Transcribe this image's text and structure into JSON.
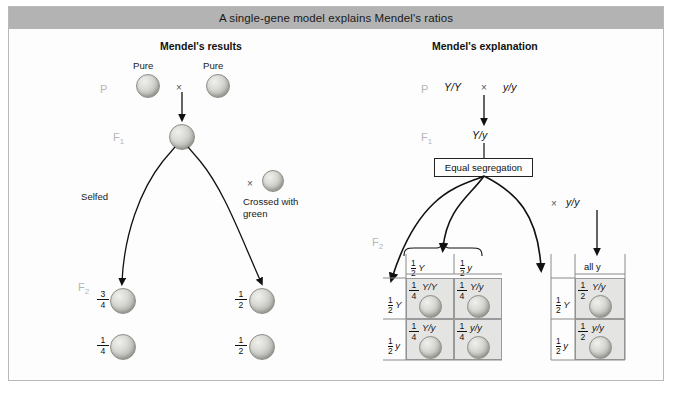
{
  "figure": {
    "title": "A single-gene model explains Mendel's ratios",
    "panels": {
      "left_title": "Mendel's results",
      "right_title": "Mendel's explanation"
    },
    "colors": {
      "title_bar": "#b3b3b3",
      "generation_label": "#b6b6b6",
      "pea_fill": "#d8d8d4",
      "punnett_shaded": "#e4e4e2",
      "punnett_plain": "#fbfbfb",
      "line": "#111111"
    }
  },
  "left_panel": {
    "generations": {
      "p": "P",
      "f1": "F",
      "f1_sub": "1",
      "f2": "F",
      "f2_sub": "2"
    },
    "parent_labels": {
      "left": "Pure",
      "right": "Pure"
    },
    "cross_symbol": "×",
    "branch_labels": {
      "selfed": "Selfed",
      "crossed_line1": "Crossed with",
      "crossed_line2": "green"
    },
    "f2_selfed": [
      {
        "num": "3",
        "den": "4"
      },
      {
        "num": "1",
        "den": "4"
      }
    ],
    "f2_testcross": [
      {
        "num": "1",
        "den": "2"
      },
      {
        "num": "1",
        "den": "2"
      }
    ]
  },
  "right_panel": {
    "generations": {
      "p": "P",
      "f1": "F",
      "f1_sub": "1",
      "f2": "F",
      "f2_sub": "2"
    },
    "p_cross": {
      "left": "Y/Y",
      "symbol": "×",
      "right": "y/y"
    },
    "f1_genotype": "Y/y",
    "segregation_box": "Equal segregation",
    "testcross_parent": {
      "symbol": "×",
      "genotype": "y/y"
    },
    "selfed_square": {
      "col_headers": [
        {
          "num": "1",
          "den": "2",
          "allele": "Y"
        },
        {
          "num": "1",
          "den": "2",
          "allele": "y"
        }
      ],
      "row_headers": [
        {
          "num": "1",
          "den": "2",
          "allele": "Y"
        },
        {
          "num": "1",
          "den": "2",
          "allele": "y"
        }
      ],
      "cells": [
        [
          {
            "num": "1",
            "den": "4",
            "genotype": "Y/Y"
          },
          {
            "num": "1",
            "den": "4",
            "genotype": "Y/y"
          }
        ],
        [
          {
            "num": "1",
            "den": "4",
            "genotype": "Y/y"
          },
          {
            "num": "1",
            "den": "4",
            "genotype": "y/y"
          }
        ]
      ]
    },
    "testcross_square": {
      "col_header": "all y",
      "row_headers": [
        {
          "num": "1",
          "den": "2",
          "allele": "Y"
        },
        {
          "num": "1",
          "den": "2",
          "allele": "y"
        }
      ],
      "cells": [
        {
          "num": "1",
          "den": "2",
          "genotype": "Y/y"
        },
        {
          "num": "1",
          "den": "2",
          "genotype": "y/y"
        }
      ]
    }
  }
}
